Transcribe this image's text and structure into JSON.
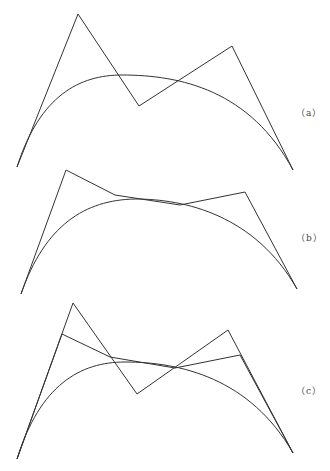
{
  "figures": [
    {
      "label": "（a）",
      "label_pos": [
        296,
        106
      ],
      "control_polygon": [
        [
          17,
          167
        ],
        [
          78,
          14
        ],
        [
          139,
          106
        ],
        [
          232,
          46
        ],
        [
          293,
          170
        ]
      ],
      "curve": {
        "from": [
          17,
          167
        ],
        "c1": [
          40,
          95
        ],
        "c2": [
          80,
          75
        ],
        "peak": [
          122,
          75
        ],
        "c3": [
          180,
          75
        ],
        "c4": [
          250,
          90
        ],
        "to": [
          293,
          170
        ]
      }
    },
    {
      "label": "（b）",
      "label_pos": [
        296,
        231
      ],
      "control_polygon": [
        [
          21,
          294
        ],
        [
          66,
          170
        ],
        [
          115,
          195
        ],
        [
          180,
          205
        ],
        [
          245,
          192
        ],
        [
          297,
          289
        ]
      ],
      "curve": {
        "from": [
          21,
          294
        ],
        "c1": [
          45,
          225
        ],
        "c2": [
          85,
          200
        ],
        "peak": [
          135,
          199
        ],
        "c3": [
          185,
          199
        ],
        "c4": [
          255,
          215
        ],
        "to": [
          297,
          289
        ]
      }
    },
    {
      "label": "（c）",
      "label_pos": [
        296,
        384
      ],
      "control_polygon": [
        [
          17,
          459
        ],
        [
          73,
          303
        ],
        [
          137,
          394
        ],
        [
          228,
          330
        ],
        [
          293,
          453
        ]
      ],
      "inner_polygon": [
        [
          17,
          459
        ],
        [
          62,
          334
        ],
        [
          110,
          357
        ],
        [
          175,
          368
        ],
        [
          240,
          355
        ],
        [
          293,
          453
        ]
      ],
      "curve": {
        "from": [
          17,
          459
        ],
        "c1": [
          40,
          385
        ],
        "c2": [
          80,
          362
        ],
        "peak": [
          125,
          362
        ],
        "c3": [
          180,
          362
        ],
        "c4": [
          250,
          378
        ],
        "to": [
          293,
          453
        ]
      }
    }
  ],
  "stroke_color": "#333333"
}
